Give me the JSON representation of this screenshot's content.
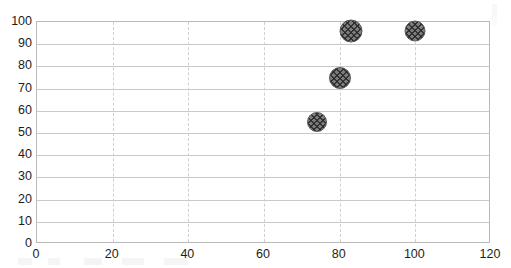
{
  "chart_data": {
    "type": "scatter",
    "title": "",
    "subtitle": "",
    "xlabel": "",
    "ylabel": "",
    "xlim": [
      0,
      120
    ],
    "ylim": [
      0,
      100
    ],
    "xticks": [
      0,
      20,
      40,
      60,
      80,
      100,
      120
    ],
    "yticks": [
      0,
      10,
      20,
      30,
      40,
      50,
      60,
      70,
      80,
      90,
      100
    ],
    "grid": {
      "horizontal": "solid",
      "vertical": "dashed",
      "horizontal_color": "#c9c9c9",
      "vertical_color": "#cfcfcf"
    },
    "legend": null,
    "legend_position": "none",
    "marker": {
      "shape": "circle",
      "fill": "#7d7d7d",
      "pattern": "crosshatch",
      "edge_color": "#5a5a5a"
    },
    "series": [
      {
        "name": "",
        "points": [
          {
            "x": 74,
            "y": 55,
            "size": 20
          },
          {
            "x": 80,
            "y": 75,
            "size": 22
          },
          {
            "x": 83,
            "y": 96,
            "size": 23
          },
          {
            "x": 100,
            "y": 96,
            "size": 21
          }
        ]
      }
    ]
  },
  "axes": {
    "y_tick_labels": [
      "100",
      "90",
      "80",
      "70",
      "60",
      "50",
      "40",
      "30",
      "20",
      "10",
      "0"
    ],
    "x_tick_labels": [
      "0",
      "20",
      "40",
      "60",
      "80",
      "100",
      "120"
    ]
  },
  "colors": {
    "plot_border": "#b9b9b9",
    "hgrid": "#c9c9c9",
    "vgrid": "#cfcfcf",
    "marker_fill": "#7d7d7d",
    "marker_edge": "#5a5a5a",
    "tick_text": "#1d1d1d",
    "background": "#ffffff"
  }
}
